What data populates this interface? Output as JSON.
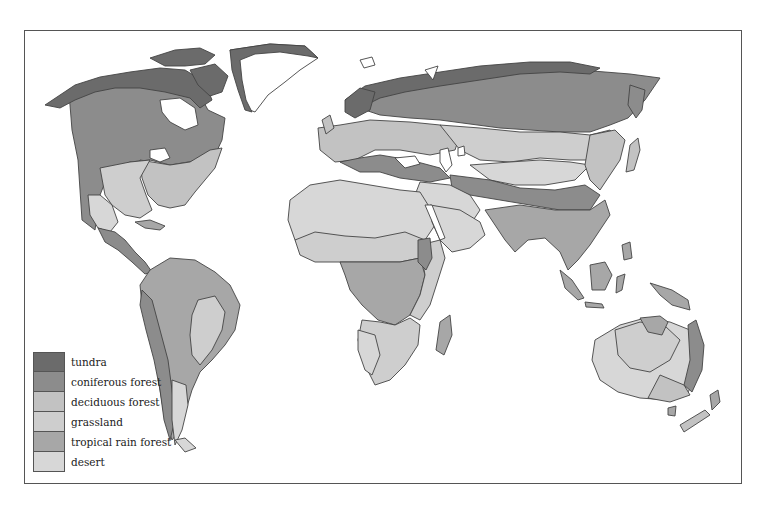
{
  "map": {
    "title": "World biomes",
    "legend": [
      {
        "label": "tundra",
        "color": "#6b6b6b"
      },
      {
        "label": "coniferous forest",
        "color": "#8c8c8c"
      },
      {
        "label": "deciduous forest",
        "color": "#c2c2c2"
      },
      {
        "label": "grassland",
        "color": "#cecece"
      },
      {
        "label": "tropical rain forest",
        "color": "#a7a7a7"
      },
      {
        "label": "desert",
        "color": "#d7d7d7"
      }
    ]
  }
}
